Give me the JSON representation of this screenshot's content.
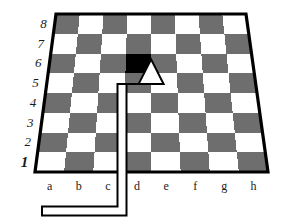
{
  "diagram": {
    "type": "chessboard-perspective",
    "highlight_square": "d6",
    "arrow": {
      "name": "pointer-arrow",
      "points_to": "d6",
      "fill_color": "#ffffff",
      "outline_color": "#000000"
    },
    "colors": {
      "light_square": "#ffffff",
      "dark_square": "#6e6e6e",
      "highlight_square": "#000000",
      "border": "#000000",
      "label": "#1a1a1a",
      "background": "#ffffff"
    },
    "ranks": [
      {
        "label": "8",
        "emphasis": false
      },
      {
        "label": "7",
        "emphasis": false
      },
      {
        "label": "6",
        "emphasis": false
      },
      {
        "label": "5",
        "emphasis": false
      },
      {
        "label": "4",
        "emphasis": false
      },
      {
        "label": "3",
        "emphasis": false
      },
      {
        "label": "2",
        "emphasis": false
      },
      {
        "label": "1",
        "emphasis": true
      }
    ],
    "files": [
      {
        "label": "a"
      },
      {
        "label": "b"
      },
      {
        "label": "c"
      },
      {
        "label": "d"
      },
      {
        "label": "e"
      },
      {
        "label": "f"
      },
      {
        "label": "g"
      },
      {
        "label": "h"
      }
    ]
  }
}
